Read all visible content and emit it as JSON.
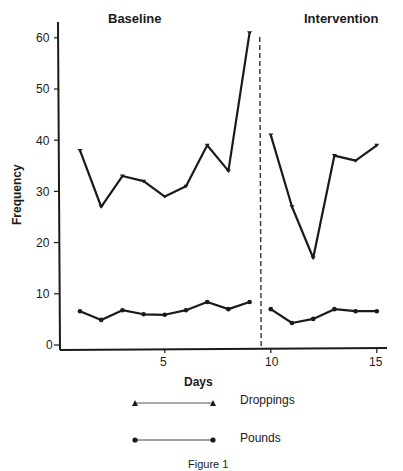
{
  "chart_data": {
    "type": "line",
    "title": "",
    "caption": "Figure 1",
    "xlabel": "Days",
    "ylabel": "Frequency",
    "ylim": [
      0,
      63
    ],
    "xlim": [
      0,
      15.5
    ],
    "y_ticks": [
      0,
      10,
      20,
      30,
      40,
      50,
      60
    ],
    "x_ticks": [
      5,
      10,
      15
    ],
    "grid": false,
    "legend_position": "bottom",
    "phases": [
      {
        "label": "Baseline",
        "days": [
          1,
          9
        ]
      },
      {
        "label": "Intervention",
        "days": [
          10,
          15
        ]
      }
    ],
    "phase_change_line": {
      "x": 9.5,
      "style": "dashed"
    },
    "series": [
      {
        "name": "Droppings",
        "marker": "triangle",
        "x": [
          1,
          2,
          3,
          4,
          5,
          6,
          7,
          8,
          9,
          10,
          11,
          12,
          13,
          14,
          15
        ],
        "values": [
          38,
          27,
          33,
          32,
          29,
          31,
          39,
          34,
          61,
          41,
          27,
          17,
          37,
          36,
          39
        ]
      },
      {
        "name": "Pounds",
        "marker": "circle",
        "x": [
          1,
          2,
          3,
          4,
          5,
          6,
          7,
          8,
          9,
          10,
          11,
          12,
          13,
          14,
          15
        ],
        "values": [
          6.6,
          4.9,
          6.8,
          6.0,
          5.9,
          6.8,
          8.4,
          7.0,
          8.4,
          7.0,
          4.3,
          5.1,
          7.0,
          6.6,
          6.6
        ]
      }
    ]
  },
  "labels": {
    "baseline": "Baseline",
    "intervention": "Intervention",
    "ylabel": "Frequency",
    "xlabel": "Days",
    "caption": "Figure 1",
    "legend_droppings": "Droppings",
    "legend_pounds": "Pounds",
    "y_ticks": [
      "60",
      "50",
      "40",
      "30",
      "20",
      "10",
      "0"
    ],
    "x_ticks": [
      "5",
      "10",
      "15"
    ]
  }
}
